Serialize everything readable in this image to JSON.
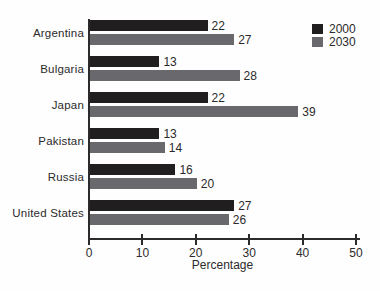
{
  "chart_data": {
    "type": "bar",
    "orientation": "horizontal",
    "title": "",
    "categories": [
      "Argentina",
      "Bulgaria",
      "Japan",
      "Pakistan",
      "Russia",
      "United States"
    ],
    "series": [
      {
        "name": "2000",
        "color": "#211e1f",
        "values": [
          22,
          13,
          22,
          13,
          16,
          27
        ]
      },
      {
        "name": "2030",
        "color": "#69686c",
        "values": [
          27,
          28,
          39,
          14,
          20,
          26
        ]
      }
    ],
    "xlabel": "Percentage",
    "xlim": [
      0,
      50
    ],
    "xticks": [
      0,
      10,
      20,
      30,
      40,
      50
    ],
    "grid": false,
    "value_labels": true,
    "legend_position": "top-right"
  },
  "colors": {
    "axis": "#2c2a2b",
    "text": "#2c2a2b",
    "background": "#fefefe"
  }
}
